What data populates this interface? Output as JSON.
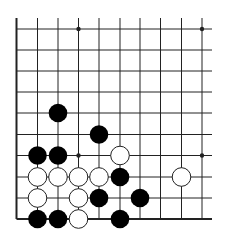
{
  "board": {
    "title": "Go board diagram (lower-left corner section)",
    "columns": 10,
    "rows": 10,
    "x_lines": [
      16.5,
      37.5,
      58,
      78.5,
      99,
      120,
      140,
      160.5,
      181.5,
      202
    ],
    "y_lines": [
      29,
      50,
      71,
      92,
      113,
      134.5,
      155.5,
      177,
      198,
      219
    ],
    "extend_top_to": 18,
    "extend_right_to": 212,
    "edges": [
      "left",
      "bottom"
    ],
    "colors": {
      "line": "#222222",
      "black_stone": "#000000",
      "white_stone": "#ffffff",
      "white_outline": "#222222",
      "background": "#ffffff"
    },
    "stone_radius": 9.3,
    "hoshi": [
      {
        "col": 3,
        "row": 0
      },
      {
        "col": 9,
        "row": 0
      },
      {
        "col": 3,
        "row": 6
      },
      {
        "col": 9,
        "row": 6
      }
    ],
    "stones": [
      {
        "color": "black",
        "col": 2,
        "row": 4
      },
      {
        "color": "black",
        "col": 4,
        "row": 5
      },
      {
        "color": "black",
        "col": 1,
        "row": 6
      },
      {
        "color": "black",
        "col": 2,
        "row": 6
      },
      {
        "color": "white",
        "col": 5,
        "row": 6
      },
      {
        "color": "white",
        "col": 1,
        "row": 7
      },
      {
        "color": "white",
        "col": 2,
        "row": 7
      },
      {
        "color": "white",
        "col": 3,
        "row": 7
      },
      {
        "color": "white",
        "col": 4,
        "row": 7
      },
      {
        "color": "black",
        "col": 5,
        "row": 7
      },
      {
        "color": "white",
        "col": 8,
        "row": 7
      },
      {
        "color": "white",
        "col": 1,
        "row": 8
      },
      {
        "color": "white",
        "col": 3,
        "row": 8
      },
      {
        "color": "black",
        "col": 4,
        "row": 8
      },
      {
        "color": "black",
        "col": 6,
        "row": 8
      },
      {
        "color": "black",
        "col": 1,
        "row": 9
      },
      {
        "color": "black",
        "col": 2,
        "row": 9
      },
      {
        "color": "white",
        "col": 3,
        "row": 9
      },
      {
        "color": "black",
        "col": 5,
        "row": 9
      }
    ]
  }
}
